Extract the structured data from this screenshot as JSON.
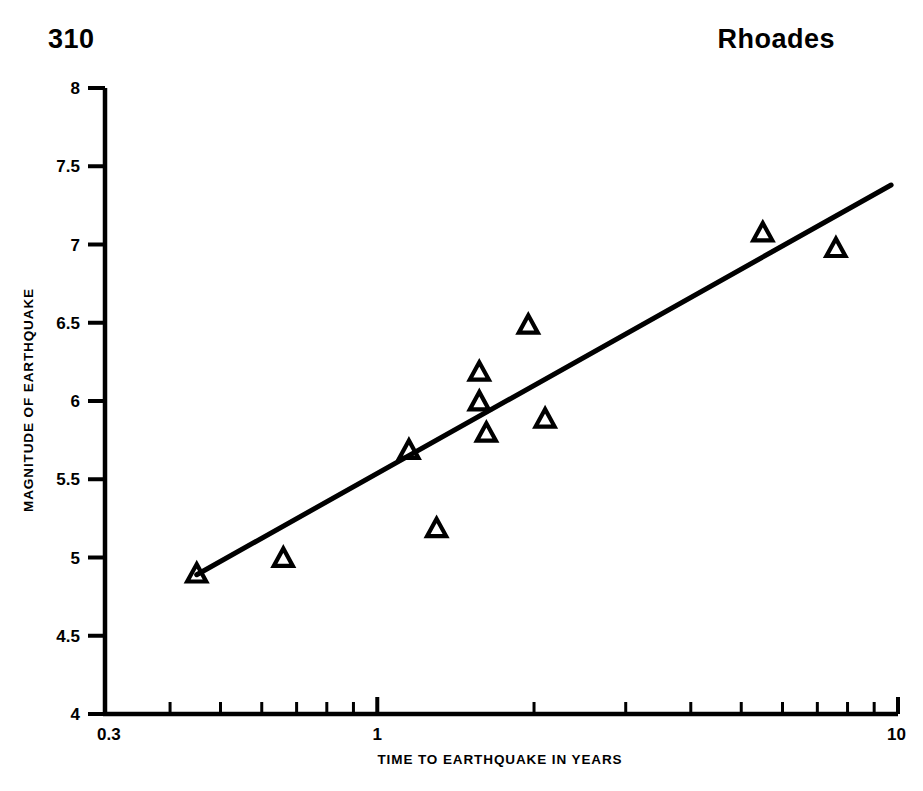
{
  "header": {
    "page_number": "310",
    "running_title": "Rhoades"
  },
  "chart_data": {
    "type": "scatter",
    "title": "",
    "xlabel": "TIME TO EARTHQUAKE IN YEARS",
    "ylabel": "MAGNITUDE OF EARTHQUAKE",
    "xscale": "log",
    "yscale": "linear",
    "xlim": [
      0.3,
      10
    ],
    "ylim": [
      4,
      8
    ],
    "grid": false,
    "legend": null,
    "marker": "open-triangle",
    "x_tick_labels": [
      "0.3",
      "1",
      "10"
    ],
    "x_tick_values": [
      0.3,
      1,
      10
    ],
    "x_minor_ticks": [
      0.4,
      0.5,
      0.6,
      0.7,
      0.8,
      0.9,
      2,
      3,
      4,
      5,
      6,
      7,
      8,
      9
    ],
    "y_tick_labels": [
      "4",
      "4.5",
      "5",
      "5.5",
      "6",
      "6.5",
      "7",
      "7.5",
      "8"
    ],
    "y_tick_values": [
      4,
      4.5,
      5,
      5.5,
      6,
      6.5,
      7,
      7.5,
      8
    ],
    "points": [
      {
        "x": 0.45,
        "y": 4.89
      },
      {
        "x": 0.66,
        "y": 4.99
      },
      {
        "x": 1.15,
        "y": 5.68
      },
      {
        "x": 1.3,
        "y": 5.18
      },
      {
        "x": 1.57,
        "y": 6.18
      },
      {
        "x": 1.57,
        "y": 5.99
      },
      {
        "x": 1.62,
        "y": 5.79
      },
      {
        "x": 1.95,
        "y": 6.48
      },
      {
        "x": 2.1,
        "y": 5.88
      },
      {
        "x": 5.5,
        "y": 7.07
      },
      {
        "x": 7.6,
        "y": 6.97
      }
    ],
    "fit_line": {
      "label": "",
      "x_start": 0.45,
      "y_start": 4.89,
      "x_end": 9.7,
      "y_end": 7.38
    }
  }
}
